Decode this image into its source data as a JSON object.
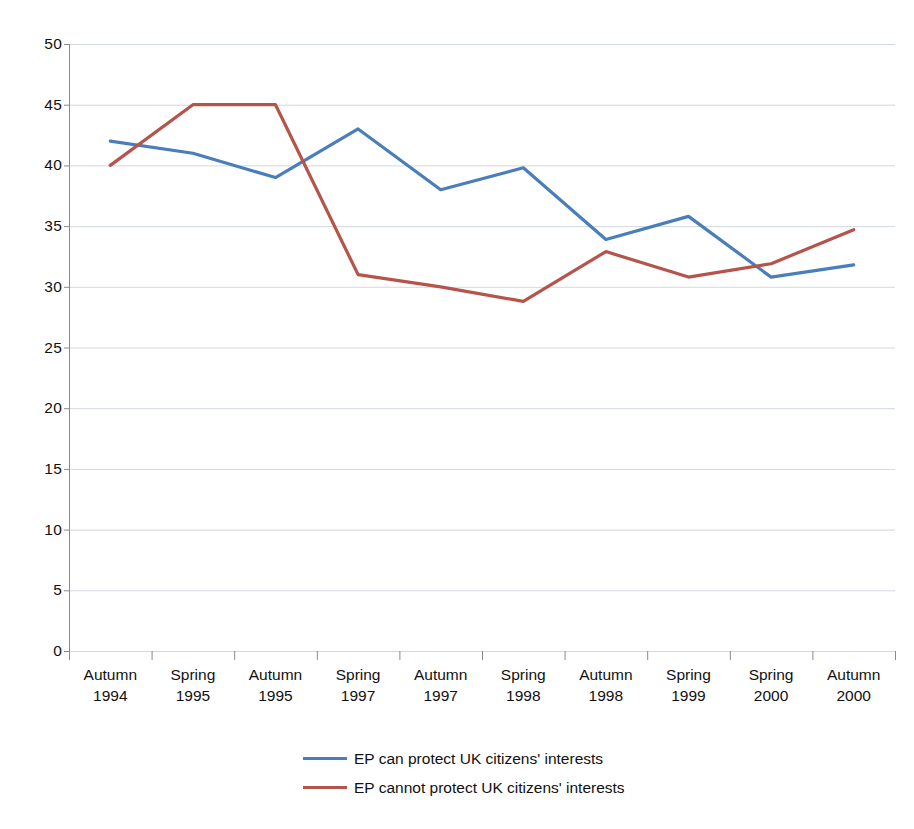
{
  "chart_data": {
    "type": "line",
    "title": "",
    "subtitle": "",
    "xlabel": "",
    "ylabel": "",
    "categories": [
      "Autumn\n1994",
      "Spring\n1995",
      "Autumn\n1995",
      "Spring\n1997",
      "Autumn\n1997",
      "Spring\n1998",
      "Autumn\n1998",
      "Spring\n1999",
      "Spring\n2000",
      "Autumn\n2000"
    ],
    "category_lines": [
      [
        "Autumn",
        "1994"
      ],
      [
        "Spring",
        "1995"
      ],
      [
        "Autumn",
        "1995"
      ],
      [
        "Spring",
        "1997"
      ],
      [
        "Autumn",
        "1997"
      ],
      [
        "Spring",
        "1998"
      ],
      [
        "Autumn",
        "1998"
      ],
      [
        "Spring",
        "1999"
      ],
      [
        "Spring",
        "2000"
      ],
      [
        "Autumn",
        "2000"
      ]
    ],
    "series": [
      {
        "name": "EP can protect UK citizens' interests",
        "color": "#4a7ebb",
        "values": [
          42,
          41,
          39,
          43,
          38,
          39.8,
          33.9,
          35.8,
          30.8,
          31.8
        ]
      },
      {
        "name": "EP cannot protect UK citizens' interests",
        "color": "#b5544a",
        "values": [
          40,
          45,
          45,
          31,
          30,
          28.8,
          32.9,
          30.8,
          31.9,
          34.7
        ]
      }
    ],
    "ylim": [
      0,
      50
    ],
    "ytick_step": 5,
    "yticks": [
      50,
      45,
      40,
      35,
      30,
      25,
      20,
      15,
      10,
      5,
      0
    ],
    "ytick_labels": [
      "50",
      "45",
      "40",
      "35",
      "30",
      "25",
      "20",
      "15",
      "10",
      "5",
      "0"
    ],
    "grid": true,
    "grid_color": "#9aa8bb",
    "axis_color": "#8a8a8a",
    "legend_position": "bottom"
  },
  "legend": {
    "entries": [
      {
        "label": "EP can protect UK citizens' interests",
        "color": "#4a7ebb"
      },
      {
        "label": "EP cannot protect UK citizens' interests",
        "color": "#b5544a"
      }
    ]
  }
}
